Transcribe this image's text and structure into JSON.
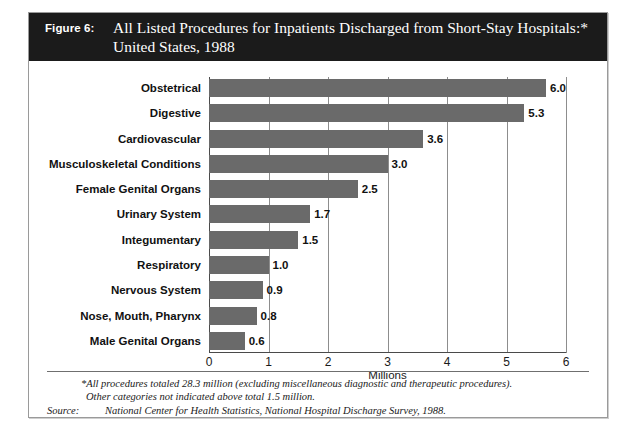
{
  "figure": {
    "number_label": "Figure 6:",
    "title_line1": "All Listed Procedures for Inpatients Discharged from Short-Stay Hospitals:*",
    "title_line2": "United States, 1988"
  },
  "footnote": {
    "line1": "*All procedures totaled 28.3 million (excluding miscellaneous diagnostic and therapeutic procedures).",
    "line2": "Other categories not indicated above total 1.5 million."
  },
  "source": {
    "label": "Source:",
    "text": "National Center for Health Statistics, National Hospital Discharge Survey, 1988."
  },
  "colors": {
    "bar": "#6a6a6a",
    "banner": "#1b1b1b",
    "banner_text": "#ffffff",
    "gridline": "#8d8d8d",
    "axis": "#4a4a4a"
  },
  "chart_data": {
    "type": "bar",
    "orientation": "horizontal",
    "title": "All Listed Procedures for Inpatients Discharged from Short-Stay Hospitals:* United States, 1988",
    "xlabel": "Millions",
    "ylabel": "",
    "xlim": [
      0,
      6
    ],
    "xticks": [
      0,
      1,
      2,
      3,
      4,
      5,
      6
    ],
    "xtick_labels": [
      "0",
      "1",
      "2",
      "3",
      "4",
      "5",
      "6"
    ],
    "grid": true,
    "legend": false,
    "categories": [
      "Obstetrical",
      "Digestive",
      "Cardiovascular",
      "Musculoskeletal Conditions",
      "Female Genital Organs",
      "Urinary System",
      "Integumentary",
      "Respiratory",
      "Nervous System",
      "Nose, Mouth, Pharynx",
      "Male Genital Organs"
    ],
    "values": [
      6.0,
      5.3,
      3.6,
      3.0,
      2.5,
      1.7,
      1.5,
      1.0,
      0.9,
      0.8,
      0.6
    ],
    "value_labels": [
      "6.0",
      "5.3",
      "3.6",
      "3.0",
      "2.5",
      "1.7",
      "1.5",
      "1.0",
      "0.9",
      "0.8",
      "0.6"
    ]
  }
}
